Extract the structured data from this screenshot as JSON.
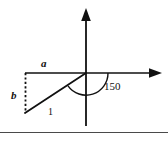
{
  "figure": {
    "kind": "coordinate-axes-vector-diagram",
    "background_color": "#ffffff",
    "stroke_color": "#111111",
    "labels": {
      "horizontal_component": "a",
      "vertical_component": "b",
      "magnitude": "1",
      "angle": "150"
    },
    "geometry": {
      "origin_x": 86,
      "origin_y": 73,
      "x_axis_start_x": 25,
      "x_axis_end_x": 162,
      "y_axis_top_y": 8,
      "y_axis_bottom_y": 126,
      "vector_tip_x": 25,
      "vector_tip_y": 113,
      "dashed_drop_x": 25,
      "dashed_drop_top_y": 73,
      "dashed_drop_bottom_y": 113,
      "arc_radius": 22,
      "angle_degrees": 150
    },
    "footer_rule": {
      "y": 132,
      "x_start": 0,
      "x_end": 168
    }
  }
}
